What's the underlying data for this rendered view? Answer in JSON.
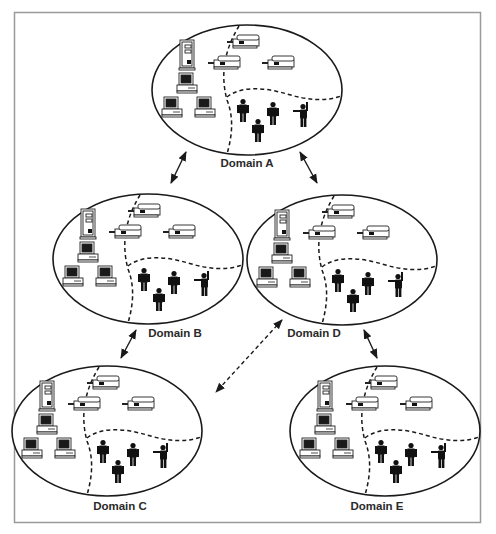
{
  "diagram": {
    "type": "network-domains",
    "frame_color": "#9a9a9a",
    "line_color": "#1a1a1a",
    "domains": [
      {
        "id": "A",
        "label": "Domain A",
        "contents": {
          "server": 1,
          "workstations": 3,
          "printers": 3,
          "users": 4
        }
      },
      {
        "id": "B",
        "label": "Domain B",
        "contents": {
          "server": 1,
          "workstations": 3,
          "printers": 3,
          "users": 4
        }
      },
      {
        "id": "D",
        "label": "Domain D",
        "contents": {
          "server": 1,
          "workstations": 3,
          "printers": 3,
          "users": 4
        }
      },
      {
        "id": "C",
        "label": "Domain C",
        "contents": {
          "server": 1,
          "workstations": 3,
          "printers": 3,
          "users": 4
        }
      },
      {
        "id": "E",
        "label": "Domain E",
        "contents": {
          "server": 1,
          "workstations": 3,
          "printers": 3,
          "users": 4
        }
      }
    ],
    "connections": [
      {
        "from": "A",
        "to": "B",
        "style": "solid",
        "direction": "bidirectional"
      },
      {
        "from": "A",
        "to": "D",
        "style": "solid",
        "direction": "bidirectional"
      },
      {
        "from": "B",
        "to": "C",
        "style": "solid",
        "direction": "bidirectional"
      },
      {
        "from": "D",
        "to": "E",
        "style": "solid",
        "direction": "bidirectional"
      },
      {
        "from": "C",
        "to": "D",
        "style": "dashed",
        "direction": "bidirectional"
      }
    ]
  }
}
